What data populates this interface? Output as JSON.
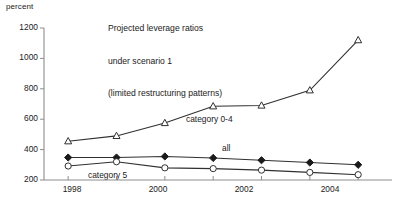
{
  "chart_data": {
    "type": "line",
    "title": "Projected leverage ratios\nunder scenario 1\n(limited restructuring patterns)",
    "title_lines": [
      "Projected leverage ratios",
      "under scenario 1",
      "(limited restructuring patterns)"
    ],
    "ylabel": "percent",
    "xlabel": "",
    "x": [
      1998,
      1999,
      2000,
      2001,
      2002,
      2003,
      2004
    ],
    "xtick_labels": [
      "1998",
      "",
      "2000",
      "",
      "2002",
      "",
      "2004"
    ],
    "xlim": [
      1997.5,
      2004.7
    ],
    "ytick_labels": [
      "200",
      "400",
      "600",
      "800",
      "1000",
      "1200"
    ],
    "yticks": [
      200,
      400,
      600,
      800,
      1000,
      1200
    ],
    "ylim": [
      200,
      1200
    ],
    "grid": false,
    "legend_position": "inline-annotations",
    "series": [
      {
        "name": "category 0-4",
        "marker": "open-triangle",
        "color": "#303030",
        "values": [
          455,
          490,
          575,
          685,
          690,
          790,
          1120
        ]
      },
      {
        "name": "all",
        "marker": "solid-diamond",
        "color": "#1a1a1a",
        "values": [
          348,
          348,
          355,
          345,
          330,
          315,
          300
        ]
      },
      {
        "name": "category 5",
        "marker": "open-circle",
        "color": "#303030",
        "values": [
          292,
          320,
          280,
          275,
          265,
          250,
          235
        ]
      }
    ],
    "annotations": [
      {
        "text": "category 0-4",
        "series": "category 0-4"
      },
      {
        "text": "all",
        "series": "all"
      },
      {
        "text": "category 5",
        "series": "category 5"
      }
    ]
  },
  "axis": {
    "unit_label": "percent",
    "y_labels": {
      "t200": "200",
      "t400": "400",
      "t600": "600",
      "t800": "800",
      "t1000": "1000",
      "t1200": "1200"
    },
    "x_labels": {
      "x1998": "1998",
      "x2000": "2000",
      "x2002": "2002",
      "x2004": "2004"
    }
  },
  "title": {
    "line1": "Projected leverage ratios",
    "line2": "under scenario 1",
    "line3": "(limited restructuring patterns)"
  },
  "labels": {
    "category04": "category 0-4",
    "all": "all",
    "category5": "category 5"
  },
  "colors": {
    "axis": "#8d8d8d",
    "line": "#303030",
    "marker_fill": "#ffffff",
    "marker_solid": "#1a1a1a",
    "background": "#ffffff"
  }
}
